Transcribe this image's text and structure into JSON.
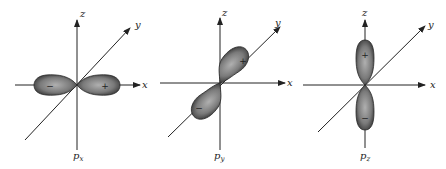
{
  "figure": {
    "panels": [
      {
        "id": "px",
        "label_main": "p",
        "label_sub": "x",
        "axes": {
          "z": "z",
          "y": "y",
          "x": "x"
        },
        "lobes": [
          {
            "sign": "−",
            "direction": "-x"
          },
          {
            "sign": "+",
            "direction": "+x"
          }
        ]
      },
      {
        "id": "py",
        "label_main": "p",
        "label_sub": "y",
        "axes": {
          "z": "z",
          "y": "y",
          "x": "x"
        },
        "lobes": [
          {
            "sign": "+",
            "direction": "+y"
          },
          {
            "sign": "−",
            "direction": "-y"
          }
        ]
      },
      {
        "id": "pz",
        "label_main": "p",
        "label_sub": "z",
        "axes": {
          "z": "z",
          "y": "y",
          "x": "x"
        },
        "lobes": [
          {
            "sign": "+",
            "direction": "+z"
          },
          {
            "sign": "−",
            "direction": "-z"
          }
        ]
      }
    ]
  },
  "colors": {
    "lobe_dark": "#3a3a3a",
    "lobe_light": "#a8a8a8",
    "axis": "#222222",
    "background": "#ffffff"
  }
}
